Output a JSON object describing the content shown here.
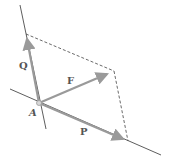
{
  "diagram": {
    "type": "parallelogram-law-force-resolution",
    "colors": {
      "vector": "#9a9a9a",
      "line_of_action": "#333333",
      "dashed": "#444444",
      "label": "#555555"
    },
    "point": {
      "label": "A",
      "x": 39,
      "y": 103
    },
    "vectors": [
      {
        "name": "Q",
        "label": "Q",
        "from": [
          39,
          103
        ],
        "to": [
          26,
          34
        ]
      },
      {
        "name": "F",
        "label": "F",
        "from": [
          39,
          103
        ],
        "to": [
          112,
          71
        ]
      },
      {
        "name": "P",
        "label": "P",
        "from": [
          39,
          103
        ],
        "to": [
          128,
          141
        ]
      }
    ],
    "lines_of_action": [
      {
        "name": "line-q",
        "from": [
          20,
          5
        ],
        "to": [
          46,
          129
        ]
      },
      {
        "name": "line-p",
        "from": [
          10,
          89
        ],
        "to": [
          161,
          155
        ]
      }
    ],
    "dashed_lines": [
      {
        "from": [
          26,
          34
        ],
        "to": [
          114,
          71
        ]
      },
      {
        "from": [
          114,
          71
        ],
        "to": [
          128,
          141
        ]
      }
    ],
    "labels": {
      "Q": "Q",
      "F": "F",
      "P": "P",
      "A": "A"
    }
  }
}
